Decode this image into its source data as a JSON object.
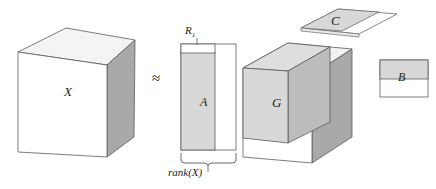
{
  "figure": {
    "type": "tensor-decomposition-diagram",
    "relation_symbol": "≈"
  },
  "labels": {
    "x": "X",
    "a": "A",
    "g": "G",
    "b": "B",
    "c": "C",
    "r1": "R",
    "r1_sub": "1",
    "rank": "rank(X)",
    "approx": "≈"
  },
  "colors": {
    "stroke": "#555555",
    "stroke_light": "#777777",
    "face_front_white": "#ffffff",
    "face_top_light": "#f2f2f2",
    "face_shaded": "#d8d8d8",
    "face_shaded_dark": "#c9c9c9",
    "face_right_dark": "#a9a9a9",
    "face_right_mid": "#bcbcbc",
    "text": "#1c1c1c"
  },
  "blocks": [
    {
      "name": "X",
      "shape": "cube",
      "label": "X"
    },
    {
      "name": "A",
      "shape": "tall-matrix",
      "label": "A",
      "top_label": "R",
      "bottom_label": "rank(X)"
    },
    {
      "name": "G",
      "shape": "cube-with-core",
      "label": "G"
    },
    {
      "name": "C",
      "shape": "flat-parallelogram",
      "label": "C"
    },
    {
      "name": "B",
      "shape": "wide-matrix",
      "label": "B"
    }
  ]
}
